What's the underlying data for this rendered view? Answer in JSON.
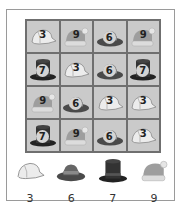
{
  "puzzle": {
    "grid": [
      [
        {
          "hat": "cap",
          "value": "3"
        },
        {
          "hat": "beanie",
          "value": "9"
        },
        {
          "hat": "fedora",
          "value": "6"
        },
        {
          "hat": "beanie",
          "value": "9"
        }
      ],
      [
        {
          "hat": "tophat",
          "value": "7"
        },
        {
          "hat": "cap",
          "value": "3"
        },
        {
          "hat": "fedora",
          "value": "6"
        },
        {
          "hat": "tophat",
          "value": "7"
        }
      ],
      [
        {
          "hat": "beanie",
          "value": "9"
        },
        {
          "hat": "fedora",
          "value": "6"
        },
        {
          "hat": "cap",
          "value": "3"
        },
        {
          "hat": "cap",
          "value": "3"
        }
      ],
      [
        {
          "hat": "tophat",
          "value": "7"
        },
        {
          "hat": "beanie",
          "value": "9"
        },
        {
          "hat": "fedora",
          "value": "6"
        },
        {
          "hat": "cap",
          "value": "3"
        }
      ]
    ],
    "legend": [
      {
        "hat": "cap",
        "icon": "baseball-cap-icon",
        "value": "3"
      },
      {
        "hat": "fedora",
        "icon": "fedora-hat-icon",
        "value": "6"
      },
      {
        "hat": "tophat",
        "icon": "top-hat-icon",
        "value": "7"
      },
      {
        "hat": "beanie",
        "icon": "beanie-hat-icon",
        "value": "9"
      }
    ],
    "colors": {
      "cell_bg": "#cacaca",
      "grid_line": "#6f6f6f",
      "frame": "#9a9a9a",
      "cap": "#e8e8e8",
      "fedora": "#555555",
      "tophat": "#2b2b2b",
      "beanie": "#9a9a9a"
    }
  }
}
